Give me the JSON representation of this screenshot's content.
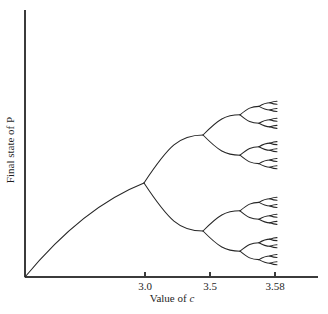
{
  "figure": {
    "title": "",
    "background_color": "#ffffff",
    "line_color": "#262626",
    "axis_color": "#3b3b3b"
  },
  "axes": {
    "x_title": "Value of ",
    "x_title_var": "c",
    "y_title": "Final state of P",
    "x_ticks": [
      {
        "label": "3.0",
        "value": 3.0,
        "px": 145
      },
      {
        "label": "3.5",
        "value": 3.5,
        "px": 210
      },
      {
        "label": "3.58",
        "value": 3.58,
        "px": 275
      }
    ],
    "origin_px": {
      "x": 25,
      "y": 277
    },
    "x_axis_end_px": 318,
    "y_axis_top_px": 10
  },
  "chart_data": {
    "type": "line",
    "title": "",
    "xlabel": "Value of c",
    "ylabel": "Final state of P",
    "xlim": [
      2.4,
      3.6
    ],
    "ylim": [
      0,
      1
    ],
    "grid": false,
    "legend": null,
    "annotations": [
      {
        "text": "3.0",
        "x": 3.0,
        "note": "first period-doubling bifurcation"
      },
      {
        "text": "3.5",
        "x": 3.5,
        "note": "beyond second bifurcation"
      },
      {
        "text": "3.58",
        "x": 3.58,
        "note": "accumulation point / onset of chaos"
      }
    ],
    "bifurcation_points": [
      {
        "order": 1,
        "c": 3.0,
        "branches": 2,
        "px": {
          "x": 144,
          "y": 183
        }
      },
      {
        "order": 2,
        "c": 3.449,
        "branches": 4,
        "px": [
          {
            "x": 200,
            "y": 141
          },
          {
            "x": 206,
            "y": 211
          }
        ]
      },
      {
        "order": 3,
        "c": 3.544,
        "branches": 8
      },
      {
        "order": 4,
        "c": 3.564,
        "branches": 16
      },
      {
        "order": 5,
        "c": 3.569,
        "branches": 32
      }
    ],
    "series": [
      {
        "name": "stable final states of P",
        "curve_start_px": {
          "x": 25,
          "y": 277
        },
        "curve_end_px": {
          "x": 144,
          "y": 183
        },
        "tree_right_edge_px": 279,
        "tree_top_px": 88,
        "tree_bottom_px": 247
      }
    ]
  },
  "tree_params": {
    "root_x": 144,
    "root_y": 183,
    "level_x": [
      144,
      203,
      240,
      259,
      270,
      277
    ],
    "spread_0": 48,
    "spread_decay": 0.42,
    "max_depth": 5
  }
}
